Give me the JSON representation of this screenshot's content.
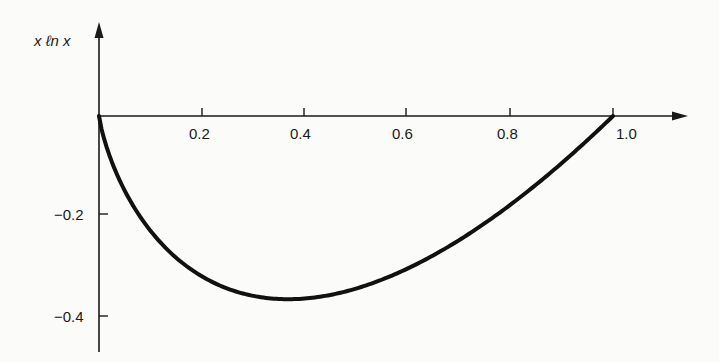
{
  "chart_data": {
    "type": "line",
    "title": "",
    "xlabel": "",
    "ylabel": "x ln x",
    "xlim": [
      0,
      1.15
    ],
    "ylim": [
      -0.45,
      0.18
    ],
    "grid": false,
    "legend": null,
    "x_ticks": [
      "0.2",
      "0.4",
      "0.6",
      "0.8",
      "1.0"
    ],
    "y_ticks": [
      "-0.2",
      "-0.4"
    ],
    "series": [
      {
        "name": "x ln x",
        "x": [
          0,
          0.02,
          0.05,
          0.1,
          0.15,
          0.2,
          0.25,
          0.3,
          0.368,
          0.4,
          0.45,
          0.5,
          0.6,
          0.7,
          0.8,
          0.9,
          1.0
        ],
        "y": [
          0,
          -0.078,
          -0.15,
          -0.23,
          -0.285,
          -0.322,
          -0.347,
          -0.361,
          -0.368,
          -0.367,
          -0.359,
          -0.347,
          -0.306,
          -0.25,
          -0.179,
          -0.095,
          0
        ]
      }
    ],
    "annotations": []
  },
  "labels": {
    "y_axis": "x ℓn x",
    "x_ticks": [
      "0.2",
      "0.4",
      "0.6",
      "0.8",
      "1.0"
    ],
    "y_ticks": [
      "−0.2",
      "−0.4"
    ]
  }
}
